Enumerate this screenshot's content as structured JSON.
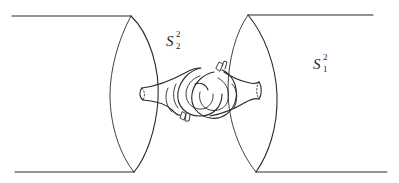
{
  "figure": {
    "stroke_color": "#2a2a2a",
    "background": "#ffffff",
    "labels": {
      "left_sphere": {
        "base": "S",
        "sup": "2",
        "sub": "2",
        "x": 166,
        "y": 34
      },
      "right_sphere": {
        "base": "S",
        "sup": "2",
        "sub": "1",
        "x": 313,
        "y": 57
      }
    },
    "left_cylinder": {
      "top_line": {
        "x1": 12,
        "y1": 16,
        "x2": 131,
        "y2": 16
      },
      "bottom_line": {
        "x1": 15,
        "y1": 172,
        "x2": 134,
        "y2": 172
      },
      "disk_front": "M131,16 C150,34 160,70 158,100 C156,130 146,158 134,172",
      "disk_back": "M131,16 C118,40 110,70 110,95 C110,125 120,155 134,172"
    },
    "right_cylinder": {
      "top_line": {
        "x1": 248,
        "y1": 15,
        "x2": 373,
        "y2": 15
      },
      "bottom_line": {
        "x1": 256,
        "y1": 172,
        "x2": 387,
        "y2": 172
      },
      "disk_front": "M248,15 C264,34 276,65 277,95 C278,128 268,155 256,172",
      "disk_back": "M248,15 C236,32 228,60 228,90 C228,122 240,152 256,172"
    },
    "tubes": {
      "left_tube_top": "M142,88 C158,86 172,80 185,73 C190,70 196,68 200,68",
      "left_tube_bottom": "M143,100 C156,101 166,104 172,110 C176,114 178,116 180,115",
      "left_tube_mouth": "M142,88 C139,91 139,97 143,100",
      "left_tube_mouth_dash": "M142,88 C145,91 145,97 143,100",
      "right_tube_top": "M224,72 C230,76 238,80 246,82 C252,84 256,84 259,82",
      "right_tube_bottom": "M210,116 C222,114 236,108 246,102 C252,99 256,98 259,99",
      "right_tube_mouth": "M259,82 C262,86 262,95 259,99",
      "right_tube_mouth_dash": "M259,82 C256,86 256,95 259,99",
      "left_ring_outer": "M201,68 C190,70 180,80 178,92 C176,106 186,116 200,116 C214,116 222,106 222,94",
      "left_ring_inner": "M200,76 C192,78 186,86 186,94 C186,104 194,110 202,109 C210,108 214,100 213,94",
      "right_ring_outer": "M222,70 C232,74 238,86 236,98 C234,112 222,120 210,118 C198,116 190,106 192,94 C194,82 204,74 214,72",
      "right_ring_inner": "M218,78 C226,82 230,90 228,100 C226,108 218,112 210,110 C202,108 198,100 200,92",
      "back_arc_left": "M168,88 C164,96 166,106 172,112",
      "back_arc_left2": "M176,84 C172,92 173,102 178,108",
      "back_arc_right": "M232,84 C238,90 238,100 234,108",
      "cuff_top_right_1": "M216,68 L219,62 L223,64 L220,71 Z",
      "cuff_top_right_2": "M222,66 L224,61 L227,62 L225,69",
      "cuff_bottom_left_1": "M182,112 L180,118 L184,120 L186,114 Z",
      "cuff_bottom_left_2": "M186,114 L185,121 L189,121 L190,115",
      "link_front_segment": "M195,84 C200,82 206,84 208,90"
    }
  }
}
